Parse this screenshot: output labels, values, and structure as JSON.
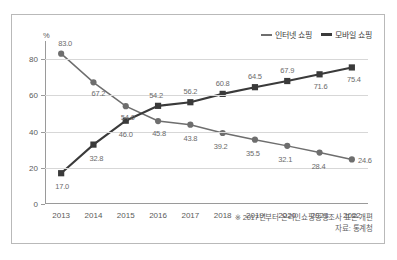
{
  "chart_data": {
    "type": "line",
    "title": "",
    "xlabel": "",
    "ylabel": "%",
    "unit_label": "%",
    "categories": [
      "2013",
      "2014",
      "2015",
      "2016",
      "2017",
      "2018",
      "2019",
      "2020",
      "2021",
      "2022"
    ],
    "ylim": [
      0,
      90
    ],
    "yticks": [
      0,
      20,
      40,
      60,
      80
    ],
    "ytick_labels": [
      "0",
      "20",
      "40",
      "60",
      "80"
    ],
    "grid": true,
    "grid_axis": "y",
    "legend_position": "top-right",
    "series": [
      {
        "name": "인터넷 쇼핑",
        "color": "#6e6e6e",
        "marker": "circle",
        "values": [
          83.0,
          67.2,
          54.0,
          45.8,
          43.8,
          39.2,
          35.5,
          32.1,
          28.4,
          24.6
        ],
        "labels": [
          "83.0",
          "67.2",
          "54.0",
          "45.8",
          "43.8",
          "39.2",
          "35.5",
          "32.1",
          "28.4",
          "24.6"
        ]
      },
      {
        "name": "모바일 쇼핑",
        "color": "#3a3a3a",
        "marker": "square",
        "values": [
          17.0,
          32.8,
          46.0,
          54.2,
          56.2,
          60.8,
          64.5,
          67.9,
          71.6,
          75.4
        ],
        "labels": [
          "17.0",
          "32.8",
          "46.0",
          "54.2",
          "56.2",
          "60.8",
          "64.5",
          "67.9",
          "71.6",
          "75.4"
        ]
      }
    ]
  },
  "legend": {
    "items": [
      {
        "label": "인터넷 쇼핑"
      },
      {
        "label": "모바일 쇼핑"
      }
    ]
  },
  "footnotes": {
    "note": "※ 2017년부터 온라인쇼핑동향조사 표본 개편",
    "source": "자료: 통계청"
  }
}
